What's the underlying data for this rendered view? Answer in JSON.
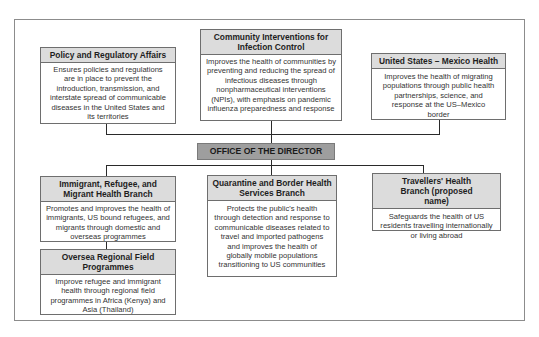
{
  "diagram": {
    "type": "org-chart",
    "center": {
      "label": "OFFICE OF THE DIRECTOR",
      "fill": "#9e9e9e"
    },
    "header_fill": "#dcdcdc",
    "top_units": [
      {
        "title": "Policy and Regulatory Affairs",
        "description": "Ensures policies and regulations are in place to prevent the introduction, transmission, and interstate spread of communicable diseases in the United States and its territories"
      },
      {
        "title": "Community Interventions for Infection Control",
        "description": "Improves the health of communities by preventing and reducing the spread of infectious diseases through nonpharmaceutical interventions (NPIs), with emphasis on pandemic influenza preparedness and response"
      },
      {
        "title": "United States – Mexico Health",
        "description": "Improves the health of migrating populations through public health partnerships, science, and response at the US–Mexico border"
      }
    ],
    "bottom_units": [
      {
        "title": "Immigrant, Refugee, and Migrant Health Branch",
        "description": "Promotes and improves the health of immigrants, US bound refugees, and migrants through domestic and overseas programmes",
        "sub_unit": {
          "title": "Oversea Regional Field Programmes",
          "description": "Improve refugee and immigrant health through regional field programmes in Africa (Kenya) and Asia (Thailand)"
        }
      },
      {
        "title": "Quarantine and Border Health Services Branch",
        "description": "Protects the public's health through detection and response to communicable diseases related to travel and imported pathogens and improves the health of globally mobile populations transitioning to US communities"
      },
      {
        "title": "Travellers' Health Branch (proposed name)",
        "description": "Safeguards the health of US residents travelling internationally or living abroad"
      }
    ]
  }
}
